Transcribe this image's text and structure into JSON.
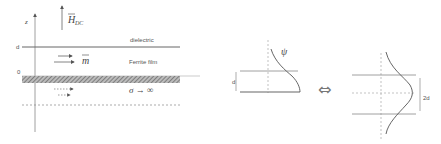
{
  "left_panel": {
    "axis_label": "z",
    "field_label": "H",
    "field_subscript": "DC",
    "level_d": "d",
    "level_0": "0",
    "layer_top": "dielectric",
    "layer_mid": "Ferrite film",
    "magnetization_label": "m",
    "conductor_label": "σ → ∞"
  },
  "middle_panel": {
    "wave_label": "ψ",
    "thickness_label": "d"
  },
  "right_panel": {
    "thickness_label": "2d"
  },
  "equivalence_symbol": "⇔"
}
